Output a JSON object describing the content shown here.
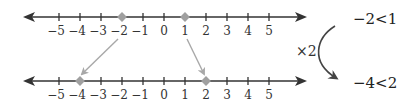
{
  "diagram": {
    "top_line": {
      "ticks": [
        -5,
        -4,
        -3,
        -2,
        -1,
        0,
        1,
        2,
        3,
        4,
        5
      ],
      "tick_labels": [
        "−5",
        "−4",
        "−3",
        "−2",
        "−1",
        "0",
        "1",
        "2",
        "3",
        "4",
        "5"
      ],
      "marked_points": [
        -2,
        1
      ]
    },
    "bottom_line": {
      "ticks": [
        -5,
        -4,
        -3,
        -2,
        -1,
        0,
        1,
        2,
        3,
        4,
        5
      ],
      "tick_labels": [
        "−5",
        "−4",
        "−3",
        "−2",
        "−1",
        "0",
        "1",
        "2",
        "3",
        "4",
        "5"
      ],
      "marked_points": [
        -4,
        2
      ]
    },
    "mapping_arrows": [
      {
        "from": -2,
        "to": -4
      },
      {
        "from": 1,
        "to": 2
      }
    ],
    "operation_label": "×2",
    "inequality_top": "−2<1",
    "inequality_bottom": "−4<2",
    "colors": {
      "axis": "#333333",
      "point": "#a0a0a0",
      "mapping_arrow": "#a8a8a8",
      "curve_arrow": "#444444"
    }
  }
}
